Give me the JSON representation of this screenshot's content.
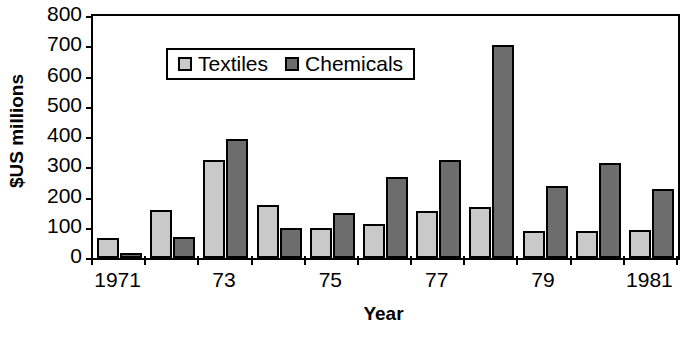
{
  "chart_data": {
    "type": "bar",
    "title": "",
    "xlabel": "Year",
    "ylabel": "$US millions",
    "ylim": [
      0,
      800
    ],
    "ytick_labels": [
      "800",
      "700",
      "600",
      "500",
      "400",
      "300",
      "200",
      "100",
      "0"
    ],
    "ytick_values": [
      800,
      700,
      600,
      500,
      400,
      300,
      200,
      100,
      0
    ],
    "grid": false,
    "legend_position": "upper-left-inside",
    "categories": [
      "1971",
      "1972",
      "1973",
      "1974",
      "1975",
      "1976",
      "1977",
      "1978",
      "1979",
      "1980",
      "1981"
    ],
    "xtick_labels": [
      "1971",
      "",
      "73",
      "",
      "75",
      "",
      "77",
      "",
      "79",
      "",
      "1981"
    ],
    "series": [
      {
        "name": "Textiles",
        "color": "#c9c9c9",
        "values": [
          65,
          160,
          325,
          175,
          98,
          112,
          155,
          170,
          88,
          90,
          92
        ]
      },
      {
        "name": "Chemicals",
        "color": "#6d6d6d",
        "values": [
          18,
          68,
          395,
          98,
          150,
          268,
          325,
          705,
          238,
          313,
          228
        ]
      }
    ]
  },
  "legend": {
    "entries": [
      {
        "label": "Textiles"
      },
      {
        "label": "Chemicals"
      }
    ]
  },
  "axes": {
    "x_title": "Year",
    "y_title": "$US millions"
  }
}
